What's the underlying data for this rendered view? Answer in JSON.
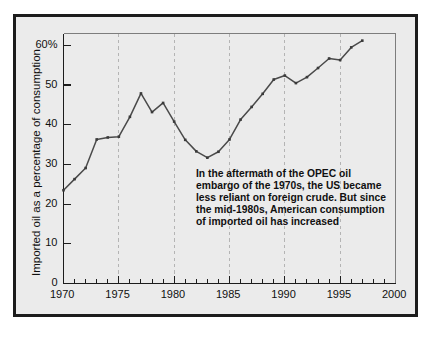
{
  "figure": {
    "background_color": "#ebebeb",
    "border_color": "#1c1c1c",
    "page_color": "#ffffff"
  },
  "annotation": {
    "lines": [
      "In the aftermath of the OPEC oil",
      "embargo of the 1970s, the US became",
      "less reliant on foreign crude.  But since",
      "the mid-1980s, American consumption",
      "of imported oil has increased"
    ]
  },
  "chart_data": {
    "type": "line",
    "title": "",
    "xlabel": "",
    "ylabel": "Imported oil as a percentage of consumption",
    "xlim": [
      1970,
      2000
    ],
    "ylim": [
      0,
      63
    ],
    "grid": "vertical-dashed",
    "legend": "none",
    "line_color": "#4a4a4a",
    "marker": "square",
    "marker_color": "#3a3a3a",
    "gridline_color": "#b4b4b4",
    "axis_color": "#1c1c1c",
    "y_ticks": [
      0,
      10,
      20,
      30,
      40,
      50,
      60
    ],
    "y_tick_labels": [
      "0",
      "10",
      "20",
      "30",
      "40",
      "50",
      "60%"
    ],
    "x_ticks": [
      1970,
      1975,
      1980,
      1985,
      1990,
      1995,
      2000
    ],
    "x_tick_labels": [
      "1970",
      "1975",
      "1980",
      "1985",
      "1990",
      "1995",
      "2000"
    ],
    "x_minor_tick_step": 1,
    "gridlines_x": [
      1975,
      1980,
      1985,
      1990,
      1995
    ],
    "x": [
      1970,
      1971,
      1972,
      1973,
      1974,
      1975,
      1976,
      1977,
      1978,
      1979,
      1980,
      1981,
      1982,
      1983,
      1984,
      1985,
      1986,
      1987,
      1988,
      1989,
      1990,
      1991,
      1992,
      1993,
      1994,
      1995,
      1996,
      1997
    ],
    "values": [
      23.5,
      26.3,
      29.1,
      36.3,
      36.8,
      37.0,
      42.0,
      47.9,
      43.2,
      45.5,
      40.8,
      36.2,
      33.3,
      31.7,
      33.2,
      36.3,
      41.3,
      44.5,
      47.8,
      51.4,
      52.4,
      50.5,
      52.0,
      54.3,
      56.7,
      56.3,
      59.5,
      61.2
    ],
    "series_name": "Imported oil as a percentage of consumption"
  }
}
